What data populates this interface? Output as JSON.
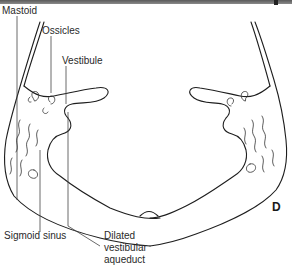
{
  "figure": {
    "panel_letter": "D",
    "labels": {
      "mastoid": "Mastoid",
      "ossicles": "Ossicles",
      "vestibule": "Vestibule",
      "sigmoid_sinus": "Sigmoid sinus",
      "dilated_vestibular_aqueduct_line1": "Dilated",
      "dilated_vestibular_aqueduct_line2": "vestibular",
      "dilated_vestibular_aqueduct_line3": "aqueduct"
    },
    "colors": {
      "line": "#1e1e1e",
      "text": "#2a2a2a",
      "background": "#ffffff",
      "top_bar": "#6e6e6e"
    }
  }
}
